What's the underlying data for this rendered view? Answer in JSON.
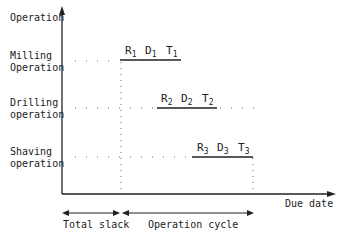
{
  "axes": {
    "y_label": "Operation",
    "x_label": "Due date"
  },
  "operations": [
    {
      "name_line1": "Milling",
      "name_line2": "Operation",
      "symbols": [
        {
          "base": "R",
          "sub": "1"
        },
        {
          "base": "D",
          "sub": "1"
        },
        {
          "base": "T",
          "sub": "1"
        }
      ]
    },
    {
      "name_line1": "Drilling",
      "name_line2": "operation",
      "symbols": [
        {
          "base": "R",
          "sub": "2"
        },
        {
          "base": "D",
          "sub": "2"
        },
        {
          "base": "T",
          "sub": "2"
        }
      ]
    },
    {
      "name_line1": "Shaving",
      "name_line2": "operation",
      "symbols": [
        {
          "base": "R",
          "sub": "3"
        },
        {
          "base": "D",
          "sub": "3"
        },
        {
          "base": "T",
          "sub": "3"
        }
      ]
    }
  ],
  "spans": {
    "total_slack": "Total slack",
    "operation_cycle": "Operation cycle"
  }
}
